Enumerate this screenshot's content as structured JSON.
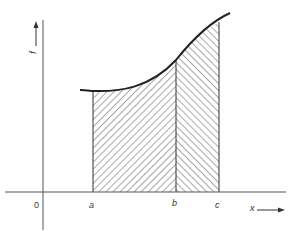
{
  "diagram": {
    "type": "area-under-curve",
    "axes": {
      "y_label": "f",
      "x_label": "x",
      "origin_label": "0"
    },
    "points": {
      "a": "a",
      "b": "b",
      "c": "c"
    },
    "regions": [
      {
        "name": "area-a-to-b",
        "from": "a",
        "to": "b",
        "hatch": "backslash"
      },
      {
        "name": "area-b-to-c",
        "from": "b",
        "to": "c",
        "hatch": "forwardslash"
      }
    ],
    "colors": {
      "line": "#222222",
      "hatch": "#555555",
      "background": "#ffffff"
    }
  }
}
